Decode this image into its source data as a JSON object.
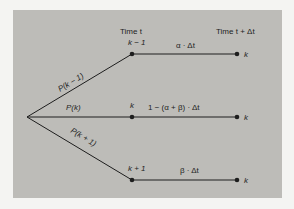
{
  "diagram": {
    "headers": {
      "time_t": "Time t",
      "time_t_dt": "Time t + Δt"
    },
    "branches": [
      {
        "prob_label": "P(k − 1)",
        "state_label": "k − 1",
        "transition_label": "α · Δt",
        "end_state": "k"
      },
      {
        "prob_label": "P(k)",
        "state_label": "k",
        "transition_label": "1 − (α + β) · Δt",
        "end_state": "k"
      },
      {
        "prob_label": "P(k + 1)",
        "state_label": "k + 1",
        "transition_label": "β · Δt",
        "end_state": "k"
      }
    ],
    "colors": {
      "panel": "#bdbcb8",
      "ink": "#1e1e1e",
      "background": "#f4f4f2"
    }
  }
}
